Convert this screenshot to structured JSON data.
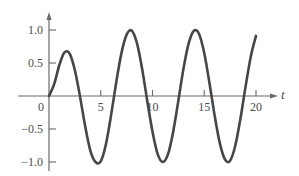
{
  "chart_data": {
    "type": "line",
    "title": "",
    "xlabel": "t",
    "ylabel": "",
    "xlim": [
      0,
      20
    ],
    "ylim": [
      -1.0,
      1.0
    ],
    "grid": false,
    "legend": null,
    "x_ticks": [
      0,
      5,
      10,
      15,
      20
    ],
    "x_tick_labels": [
      "0",
      "5",
      "10",
      "15",
      "20"
    ],
    "y_ticks": [
      1.0,
      0.5,
      -0.5,
      -1.0
    ],
    "y_tick_labels": [
      "1.0",
      "0.5",
      "−0.5",
      "−1.0"
    ],
    "series": [
      {
        "name": "y(t)",
        "color": "#464646",
        "x": [
          0,
          0.5,
          1,
          1.5,
          2,
          2.5,
          3,
          3.5,
          4,
          4.5,
          5,
          5.5,
          6,
          6.5,
          7,
          7.5,
          8,
          8.5,
          9,
          9.5,
          10,
          10.5,
          11,
          11.5,
          12,
          12.5,
          13,
          13.5,
          14,
          14.5,
          15,
          15.5,
          16,
          16.5,
          17,
          17.5,
          18,
          18.5,
          19,
          19.5,
          20
        ],
        "values": [
          0,
          0.18,
          0.47,
          0.66,
          0.64,
          0.39,
          -0.01,
          -0.46,
          -0.83,
          -1.0,
          -0.99,
          -0.73,
          -0.29,
          0.21,
          0.65,
          0.93,
          0.99,
          0.8,
          0.41,
          -0.08,
          -0.54,
          -0.88,
          -1.0,
          -0.88,
          -0.54,
          -0.07,
          0.42,
          0.8,
          0.99,
          0.94,
          0.65,
          0.2,
          -0.29,
          -0.71,
          -0.96,
          -0.98,
          -0.75,
          -0.34,
          0.15,
          0.6,
          0.91
        ]
      }
    ]
  },
  "colors": {
    "axis": "#6a6a6a",
    "curve": "#464646",
    "text": "#4a4a4a"
  }
}
